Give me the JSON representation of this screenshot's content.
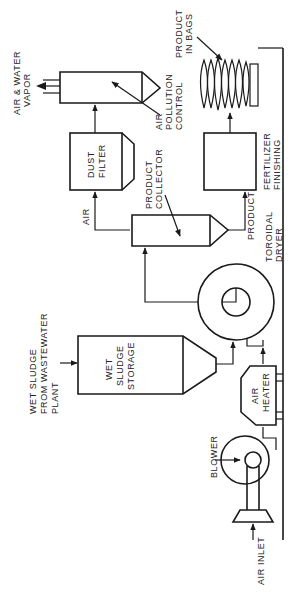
{
  "diagram": {
    "orientation": "rotated-90-ccw",
    "labels": {
      "air_water_vapor": [
        "AIR & WATER",
        "VAPOR"
      ],
      "air_pollution_control": [
        "AIR",
        "POLLUTION",
        "CONTROL"
      ],
      "product_in_bags": [
        "PRODUCT",
        "IN BAGS"
      ],
      "dust_filter": [
        "DUST",
        "FILTER"
      ],
      "air": "AIR",
      "product_collector": [
        "PRODUCT",
        "COLLECTOR"
      ],
      "fertilizer_finishing": [
        "FERTILIZER",
        "FINISHING"
      ],
      "product": "PRODUCT",
      "toroidal_dryer": [
        "TOROIDAL",
        "DRYER"
      ],
      "wet_sludge_source": [
        "WET SLUDGE",
        "FROM WASTEWATER",
        "PLANT"
      ],
      "wet_sludge_storage": [
        "WET",
        "SLUDGE",
        "STORAGE"
      ],
      "air_heater": [
        "AIR",
        "HEATER"
      ],
      "blower": "BLOWER",
      "air_inlet": "AIR INLET"
    },
    "nodes": [
      {
        "id": "air-pollution-control",
        "label": "AIR POLLUTION CONTROL"
      },
      {
        "id": "dust-filter",
        "label": "DUST FILTER"
      },
      {
        "id": "product-collector",
        "label": "PRODUCT COLLECTOR"
      },
      {
        "id": "fertilizer-finishing",
        "label": "FERTILIZER FINISHING"
      },
      {
        "id": "product-in-bags",
        "label": "PRODUCT IN BAGS"
      },
      {
        "id": "toroidal-dryer",
        "label": "TOROIDAL DRYER"
      },
      {
        "id": "wet-sludge-storage",
        "label": "WET SLUDGE STORAGE"
      },
      {
        "id": "air-heater",
        "label": "AIR HEATER"
      },
      {
        "id": "blower",
        "label": "BLOWER"
      }
    ],
    "edges": [
      {
        "from": "air-inlet",
        "to": "blower"
      },
      {
        "from": "blower",
        "to": "air-heater"
      },
      {
        "from": "air-heater",
        "to": "toroidal-dryer"
      },
      {
        "from": "wet-sludge-source",
        "to": "wet-sludge-storage"
      },
      {
        "from": "wet-sludge-storage",
        "to": "toroidal-dryer"
      },
      {
        "from": "toroidal-dryer",
        "to": "product-collector"
      },
      {
        "from": "product-collector",
        "to": "dust-filter",
        "label": "AIR"
      },
      {
        "from": "product-collector",
        "to": "fertilizer-finishing",
        "label": "PRODUCT"
      },
      {
        "from": "fertilizer-finishing",
        "to": "product-in-bags"
      },
      {
        "from": "dust-filter",
        "to": "air-pollution-control"
      },
      {
        "from": "air-pollution-control",
        "to": "air-water-vapor"
      }
    ]
  }
}
